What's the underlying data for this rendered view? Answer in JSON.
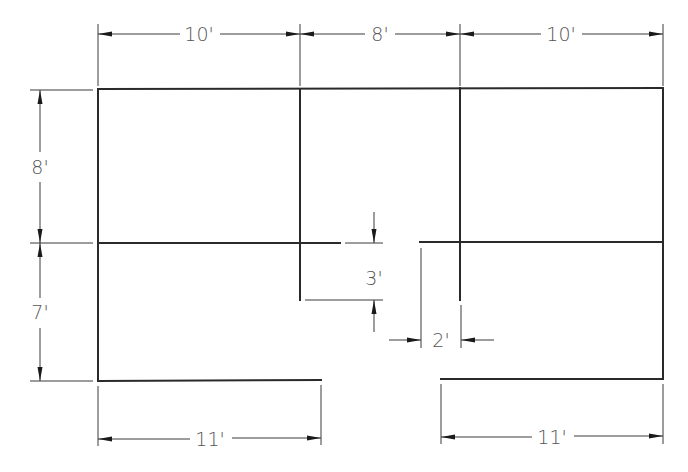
{
  "drawing": {
    "type": "floor-plan-dimension-drawing",
    "colors": {
      "wall": "#2a2a2a",
      "dimension": "#3a3a3a",
      "text": "#555555",
      "background": "#ffffff"
    },
    "dimensions": {
      "top": [
        {
          "label": "10'",
          "x1": 98,
          "x2": 300,
          "y": 34,
          "lx": 199
        },
        {
          "label": "8'",
          "x1": 300,
          "x2": 460,
          "y": 34,
          "lx": 380
        },
        {
          "label": "10'",
          "x1": 460,
          "x2": 663,
          "y": 34,
          "lx": 561
        }
      ],
      "left": [
        {
          "label": "8'",
          "y1": 90,
          "y2": 243,
          "x": 40,
          "ly": 167
        },
        {
          "label": "7'",
          "y1": 243,
          "y2": 381,
          "x": 40,
          "ly": 312
        }
      ],
      "bottom": [
        {
          "label": "11'",
          "x1": 98,
          "x2": 321,
          "y": 439,
          "lx": 210
        },
        {
          "label": "11'",
          "x1": 441,
          "x2": 663,
          "y": 437,
          "lx": 552
        }
      ],
      "inner": [
        {
          "label": "3'",
          "orientation": "vertical",
          "value": "3'"
        },
        {
          "label": "2'",
          "orientation": "horizontal",
          "value": "2'"
        }
      ]
    }
  }
}
